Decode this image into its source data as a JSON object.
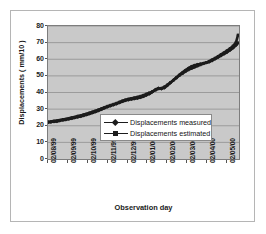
{
  "chart_data": {
    "type": "line",
    "title": "",
    "xlabel": "Observation day",
    "ylabel": "Displacements ( mm/10 )",
    "xlim": [
      0,
      9.6
    ],
    "ylim": [
      0,
      80
    ],
    "ytick_step": 10,
    "grid": true,
    "grid_axis": "y",
    "legend_position": "center",
    "plot_background": "#c9c9c9",
    "line_color": "#1c1c1c",
    "categories": [
      "02/08/99",
      "02/09/99",
      "02/10/99",
      "02/11/99",
      "02/12/99",
      "02/01/00",
      "02/02/00",
      "02/03/00",
      "02/04/00",
      "02/05/00"
    ],
    "yticks": [
      0,
      10,
      20,
      30,
      40,
      50,
      60,
      70,
      80
    ],
    "series": [
      {
        "name": "Displacements measured",
        "marker": "diamond",
        "color": "#1c1c1c",
        "x": [
          0.0,
          0.15,
          0.3,
          0.45,
          0.6,
          0.75,
          0.9,
          1.05,
          1.2,
          1.35,
          1.5,
          1.65,
          1.8,
          1.95,
          2.1,
          2.25,
          2.4,
          2.55,
          2.7,
          2.85,
          3.0,
          3.15,
          3.3,
          3.45,
          3.6,
          3.75,
          3.9,
          4.05,
          4.2,
          4.35,
          4.5,
          4.65,
          4.8,
          4.95,
          5.1,
          5.25,
          5.4,
          5.55,
          5.7,
          5.85,
          6.0,
          6.15,
          6.3,
          6.45,
          6.6,
          6.75,
          6.9,
          7.05,
          7.2,
          7.35,
          7.5,
          7.65,
          7.8,
          7.95,
          8.1,
          8.25,
          8.4,
          8.55,
          8.7,
          8.85,
          9.0,
          9.15,
          9.3,
          9.45,
          9.55
        ],
        "y": [
          22.0,
          22.2,
          22.5,
          22.6,
          23.0,
          23.4,
          23.6,
          24.0,
          24.4,
          24.8,
          25.2,
          25.6,
          26.1,
          26.6,
          27.2,
          27.8,
          28.4,
          29.1,
          29.9,
          30.7,
          31.4,
          32.0,
          32.6,
          33.2,
          33.9,
          34.6,
          35.2,
          35.6,
          36.0,
          36.3,
          36.6,
          37.0,
          37.6,
          38.4,
          39.2,
          40.4,
          41.8,
          42.6,
          42.2,
          42.8,
          44.2,
          45.8,
          47.4,
          49.0,
          50.6,
          52.0,
          53.4,
          54.6,
          55.6,
          56.3,
          56.8,
          57.2,
          57.6,
          57.9,
          58.4,
          59.2,
          60.2,
          61.2,
          62.2,
          63.2,
          64.2,
          65.4,
          66.8,
          68.4,
          69.8
        ]
      },
      {
        "name": "Displacements estimated",
        "marker": "square",
        "color": "#1c1c1c",
        "x": [
          0.0,
          0.15,
          0.3,
          0.45,
          0.6,
          0.75,
          0.9,
          1.05,
          1.2,
          1.35,
          1.5,
          1.65,
          1.8,
          1.95,
          2.1,
          2.25,
          2.4,
          2.55,
          2.7,
          2.85,
          3.0,
          3.15,
          3.3,
          3.45,
          3.6,
          3.75,
          3.9,
          4.05,
          4.2,
          4.35,
          4.5,
          4.65,
          4.8,
          4.95,
          5.1,
          5.25,
          5.4,
          5.55,
          5.7,
          5.85,
          6.0,
          6.15,
          6.3,
          6.45,
          6.6,
          6.75,
          6.9,
          7.05,
          7.2,
          7.35,
          7.5,
          7.65,
          7.8,
          7.95,
          8.1,
          8.25,
          8.4,
          8.55,
          8.7,
          8.85,
          9.0,
          9.15,
          9.3,
          9.45,
          9.55
        ],
        "y": [
          22.4,
          22.6,
          22.9,
          23.1,
          23.4,
          23.8,
          24.1,
          24.5,
          24.9,
          25.3,
          25.8,
          26.2,
          26.7,
          27.2,
          27.8,
          28.4,
          29.0,
          29.7,
          30.4,
          31.1,
          31.8,
          32.4,
          33.0,
          33.6,
          34.3,
          35.0,
          35.6,
          36.1,
          36.5,
          36.9,
          37.3,
          37.8,
          38.4,
          39.1,
          39.8,
          40.6,
          41.4,
          42.2,
          42.6,
          43.4,
          44.6,
          46.0,
          47.4,
          48.8,
          50.2,
          51.4,
          52.6,
          53.6,
          54.4,
          55.2,
          55.9,
          56.6,
          57.3,
          58.0,
          58.8,
          59.7,
          60.7,
          61.8,
          62.9,
          64.0,
          65.2,
          66.5,
          68.0,
          70.2,
          74.6
        ]
      }
    ]
  },
  "legend": {
    "items": [
      {
        "label": "Displacements measured",
        "marker": "diamond"
      },
      {
        "label": "Displacements estimated",
        "marker": "square"
      }
    ]
  }
}
